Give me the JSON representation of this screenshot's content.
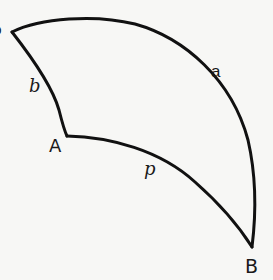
{
  "figure": {
    "colors": {
      "stroke": "#111111",
      "background": "#f7f7f5",
      "text": "#1a1a1a"
    },
    "vertices": [
      {
        "id": "top_left",
        "label": "",
        "x": 12,
        "y": 32
      },
      {
        "id": "A",
        "label": "A",
        "x": 67,
        "y": 136
      },
      {
        "id": "B",
        "label": "B",
        "x": 252,
        "y": 247
      }
    ],
    "arcs": [
      {
        "id": "a",
        "label": "a",
        "from": "top_left",
        "to": "B"
      },
      {
        "id": "b",
        "label": "b",
        "from": "top_left",
        "to": "A"
      },
      {
        "id": "p",
        "label": "p",
        "from": "A",
        "to": "B"
      }
    ],
    "labels": {
      "partial_left": "o",
      "arc_a": "a",
      "arc_b": "b",
      "arc_p": "p",
      "vertex_A": "A",
      "vertex_B": "B"
    }
  }
}
